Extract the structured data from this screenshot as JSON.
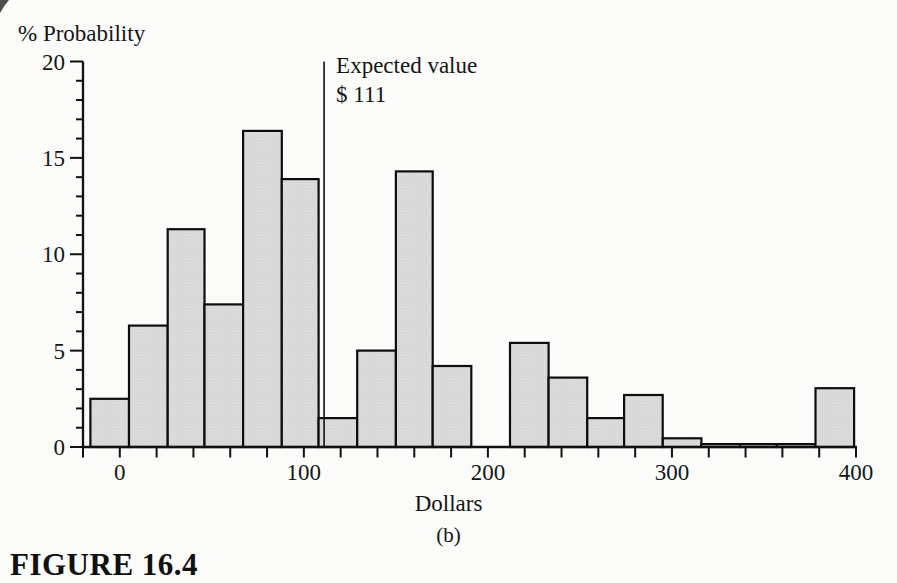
{
  "figure": {
    "label": "FIGURE 16.4"
  },
  "chart_data": {
    "type": "bar",
    "variant": "histogram",
    "title": "",
    "xlabel": "Dollars",
    "ylabel": "% Probability",
    "caption": "(b)",
    "xlim": [
      -20,
      400
    ],
    "ylim": [
      0,
      20
    ],
    "grid": "off",
    "legend": "none",
    "x_tick_values": [
      0,
      100,
      200,
      300,
      400
    ],
    "x_tick_labels": [
      "0",
      "100",
      "200",
      "300",
      "400"
    ],
    "x_minor_tick_step": 20,
    "y_tick_values": [
      0,
      5,
      10,
      15,
      20
    ],
    "y_tick_labels": [
      "0",
      "5",
      "10",
      "15",
      "20"
    ],
    "y_minor_tick_step": 1,
    "bin_edges_dollars": [
      -16,
      5,
      26,
      46,
      67,
      88,
      108,
      129,
      150,
      170,
      191,
      212,
      233,
      254,
      274,
      295,
      316,
      337,
      357,
      378,
      399
    ],
    "bin_probabilities_pct": [
      2.5,
      6.3,
      11.3,
      7.4,
      16.4,
      13.9,
      1.5,
      5.0,
      14.3,
      4.2,
      0,
      5.4,
      3.6,
      1.5,
      2.7,
      0.45,
      0.15,
      0.15,
      0.15,
      3.05
    ],
    "annotation": {
      "line1": "Expected value",
      "line2": "$ 111",
      "x_dollars": 111
    },
    "colors": {
      "bar_fill": "#dcdcdc",
      "bar_stroke": "#0d0d0d",
      "axis": "#111111",
      "annotation_line": "#1c1c1c",
      "background": "#fbfbf9"
    }
  }
}
